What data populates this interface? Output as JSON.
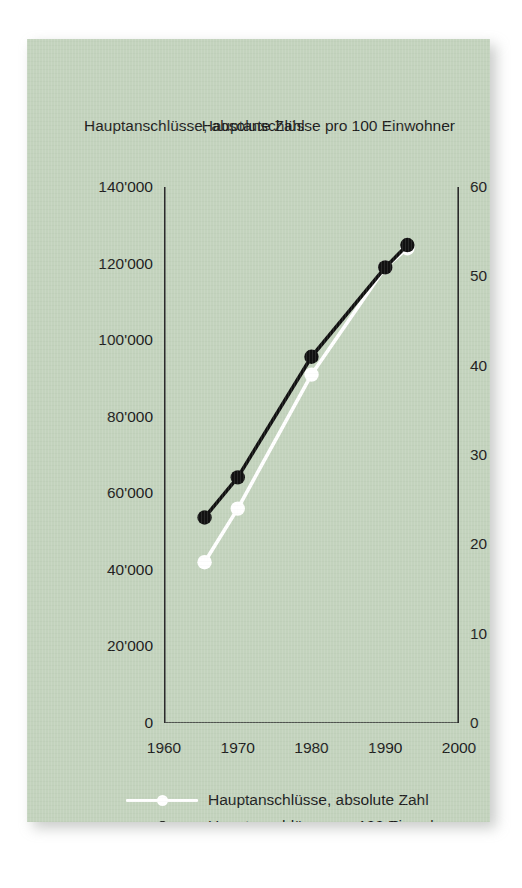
{
  "panel": {
    "background_color": "#c3d3bd"
  },
  "chart_data": {
    "type": "line",
    "title": "",
    "subtitle": "",
    "xlabel": "",
    "ylabel": "Hauptanschlüsse, absolute Zahl",
    "y2label": "Hauptanschlüsse pro 100 Einwohner",
    "grid": false,
    "legend_position": "bottom",
    "xlim": [
      1960,
      2000
    ],
    "xticks": [
      1960,
      1970,
      1980,
      1990,
      2000
    ],
    "xticklabels": [
      "1960",
      "1970",
      "1980",
      "1990",
      "2000"
    ],
    "ylim": [
      0,
      140000
    ],
    "yticks": [
      0,
      20000,
      40000,
      60000,
      80000,
      100000,
      120000,
      140000
    ],
    "yticklabels": [
      "0",
      "20'000",
      "40'000",
      "60'000",
      "80'000",
      "100'000",
      "120'000",
      "140'000"
    ],
    "y2lim": [
      0,
      60
    ],
    "y2ticks": [
      0,
      10,
      20,
      30,
      40,
      50,
      60
    ],
    "y2ticklabels": [
      "0",
      "10",
      "20",
      "30",
      "40",
      "50",
      "60"
    ],
    "series": [
      {
        "name": "Hauptanschlüsse, absolute Zahl",
        "axis": "left",
        "color": "#ffffff",
        "marker": "circle",
        "x": [
          1965.5,
          1970,
          1980,
          1990,
          1993
        ],
        "values": [
          42000,
          56000,
          91000,
          119000,
          124000
        ]
      },
      {
        "name": "Hauptanschlüsse pro 100 Einwohner",
        "axis": "right",
        "color": "#111111",
        "marker": "circle",
        "x": [
          1965.5,
          1970,
          1980,
          1990,
          1993
        ],
        "values": [
          23,
          27.5,
          41,
          51,
          53.5
        ]
      }
    ],
    "legend": [
      {
        "label": "Hauptanschlüsse, absolute Zahl",
        "color": "#ffffff"
      },
      {
        "label": "Hauptanschlüsse pro 100 Einwohner",
        "color": "#111111"
      }
    ]
  }
}
